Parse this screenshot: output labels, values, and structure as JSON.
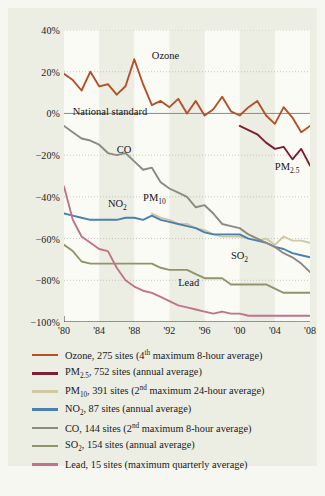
{
  "chart_data": {
    "type": "line",
    "title": "",
    "xlabel": "",
    "ylabel": "",
    "xlim": [
      1980,
      2008
    ],
    "ylim": [
      -100,
      40
    ],
    "grid": "dotted-horizontal",
    "legend_position": "below",
    "ytick_labels": [
      "40%",
      "20%",
      "0%",
      "-20%",
      "-40%",
      "-60%",
      "-80%",
      "-100%"
    ],
    "ytick_values": [
      40,
      20,
      0,
      -20,
      -40,
      -60,
      -80,
      -100
    ],
    "xtick_labels": [
      "'80",
      "'84",
      "'88",
      "'92",
      "'96",
      "'00",
      "'04",
      "'08"
    ],
    "xtick_values": [
      1980,
      1984,
      1988,
      1992,
      1996,
      2000,
      2004,
      2008
    ],
    "annotations": [
      {
        "text": "Ozone",
        "x": 1990,
        "y": 27
      },
      {
        "text": "National standard",
        "x": 1981,
        "y": 0
      },
      {
        "text": "CO",
        "x": 1986,
        "y": -18
      },
      {
        "text": "NO2",
        "x": 1985,
        "y": -44
      },
      {
        "text": "PM10",
        "x": 1989,
        "y": -41
      },
      {
        "text": "PM2.5",
        "x": 2004,
        "y": -26
      },
      {
        "text": "SO2",
        "x": 1999,
        "y": -69
      },
      {
        "text": "Lead",
        "x": 1993,
        "y": -82
      }
    ],
    "reference_line": {
      "label": "National standard",
      "y": 0,
      "color": "#8c8c84"
    },
    "series": [
      {
        "name": "Ozone",
        "label": "Ozone, 275 sites (4th maximum 8-hour average)",
        "color": "#b4502a",
        "x": [
          1980,
          1981,
          1982,
          1983,
          1984,
          1985,
          1986,
          1987,
          1988,
          1989,
          1990,
          1991,
          1992,
          1993,
          1994,
          1995,
          1996,
          1997,
          1998,
          1999,
          2000,
          2001,
          2002,
          2003,
          2004,
          2005,
          2006,
          2007,
          2008
        ],
        "values": [
          19,
          16,
          11,
          20,
          13,
          14,
          9,
          13,
          26,
          14,
          4,
          6,
          3,
          7,
          0,
          6,
          -1,
          2,
          8,
          1,
          -1,
          3,
          6,
          -1,
          -5,
          3,
          -2,
          -9,
          -6
        ]
      },
      {
        "name": "PM2.5",
        "label": "PM2.5, 752 sites (annual average)",
        "color": "#7d1f31",
        "x": [
          2000,
          2001,
          2002,
          2003,
          2004,
          2005,
          2006,
          2007,
          2008
        ],
        "values": [
          -6,
          -8,
          -10,
          -14,
          -17,
          -16,
          -22,
          -17,
          -25
        ]
      },
      {
        "name": "PM10",
        "label": "PM10, 391 sites (2nd maximum 24-hour average)",
        "color": "#cfc8a0",
        "x": [
          1990,
          1991,
          1992,
          1993,
          1994,
          1995,
          1996,
          1997,
          1998,
          1999,
          2000,
          2001,
          2002,
          2003,
          2004,
          2005,
          2006,
          2007,
          2008
        ],
        "values": [
          -48,
          -50,
          -51,
          -53,
          -53,
          -55,
          -56,
          -58,
          -59,
          -59,
          -59,
          -60,
          -61,
          -60,
          -63,
          -59,
          -61,
          -61,
          -62
        ]
      },
      {
        "name": "NO2",
        "label": "NO2, 87 sites (annual average)",
        "color": "#4a7fb0",
        "x": [
          1980,
          1981,
          1982,
          1983,
          1984,
          1985,
          1986,
          1987,
          1988,
          1989,
          1990,
          1991,
          1992,
          1993,
          1994,
          1995,
          1996,
          1997,
          1998,
          1999,
          2000,
          2001,
          2002,
          2003,
          2004,
          2005,
          2006,
          2007,
          2008
        ],
        "values": [
          -48,
          -49,
          -50,
          -51,
          -51,
          -51,
          -51,
          -50,
          -50,
          -51,
          -49,
          -51,
          -52,
          -53,
          -54,
          -55,
          -57,
          -58,
          -58,
          -58,
          -58,
          -60,
          -61,
          -62,
          -64,
          -65,
          -67,
          -68,
          -69
        ]
      },
      {
        "name": "CO",
        "label": "CO, 144 sites (2nd maximum 8-hour average)",
        "color": "#8a8a82",
        "x": [
          1980,
          1981,
          1982,
          1983,
          1984,
          1985,
          1986,
          1987,
          1988,
          1989,
          1990,
          1991,
          1992,
          1993,
          1994,
          1995,
          1996,
          1997,
          1998,
          1999,
          2000,
          2001,
          2002,
          2003,
          2004,
          2005,
          2006,
          2007,
          2008
        ],
        "values": [
          -6,
          -9,
          -12,
          -13,
          -15,
          -19,
          -20,
          -19,
          -23,
          -27,
          -26,
          -33,
          -36,
          -38,
          -40,
          -45,
          -44,
          -48,
          -53,
          -54,
          -55,
          -58,
          -60,
          -62,
          -64,
          -67,
          -69,
          -72,
          -76
        ]
      },
      {
        "name": "SO2",
        "label": "SO2, 154 sites (annual average)",
        "color": "#93936b",
        "x": [
          1980,
          1981,
          1982,
          1983,
          1984,
          1985,
          1986,
          1987,
          1988,
          1989,
          1990,
          1991,
          1992,
          1993,
          1994,
          1995,
          1996,
          1997,
          1998,
          1999,
          2000,
          2001,
          2002,
          2003,
          2004,
          2005,
          2006,
          2007,
          2008
        ],
        "values": [
          -63,
          -66,
          -71,
          -72,
          -72,
          -72,
          -72,
          -72,
          -72,
          -72,
          -72,
          -74,
          -75,
          -75,
          -75,
          -77,
          -79,
          -79,
          -79,
          -82,
          -82,
          -82,
          -82,
          -82,
          -84,
          -86,
          -86,
          -86,
          -86
        ]
      },
      {
        "name": "Lead",
        "label": "Lead, 15 sites (maximum quarterly average)",
        "color": "#c0738a",
        "x": [
          1980,
          1981,
          1982,
          1983,
          1984,
          1985,
          1986,
          1987,
          1988,
          1989,
          1990,
          1991,
          1992,
          1993,
          1994,
          1995,
          1996,
          1997,
          1998,
          1999,
          2000,
          2001,
          2002,
          2003,
          2004,
          2005,
          2006,
          2007,
          2008
        ],
        "values": [
          -35,
          -51,
          -59,
          -62,
          -65,
          -66,
          -74,
          -80,
          -83,
          -85,
          -86,
          -88,
          -90,
          -92,
          -93,
          -94,
          -95,
          -96,
          -95,
          -96,
          -96,
          -97,
          -97,
          -97,
          -97,
          -97,
          -97,
          -97,
          -97
        ]
      }
    ]
  },
  "legend": {
    "items": [
      {
        "color": "#b4502a",
        "name": "Ozone",
        "sub": "",
        "text": "Ozone, 275 sites (4",
        "sup": "th",
        "tail": " maximum 8-hour average)"
      },
      {
        "color": "#7d1f31",
        "name": "PM",
        "sub": "2.5",
        "text": "",
        "sup": "",
        "tail": ", 752 sites (annual average)"
      },
      {
        "color": "#cfc8a0",
        "name": "PM",
        "sub": "10",
        "text": "",
        "sup": "",
        "tail": ", 391 sites (2"
      },
      {
        "color": "#4a7fb0",
        "name": "NO",
        "sub": "2",
        "text": "",
        "sup": "",
        "tail": ", 87 sites (annual average)"
      },
      {
        "color": "#8a8a82",
        "name": "CO",
        "sub": "",
        "text": "",
        "sup": "",
        "tail": ", 144 sites (2"
      },
      {
        "color": "#93936b",
        "name": "SO",
        "sub": "2",
        "text": "",
        "sup": "",
        "tail": ", 154 sites (annual average)"
      },
      {
        "color": "#c0738a",
        "name": "Lead",
        "sub": "",
        "text": "",
        "sup": "",
        "tail": ", 15 sites (maximum quarterly average)"
      }
    ],
    "rows": [
      "Ozone, 275 sites (4th maximum 8-hour average)",
      "PM2.5, 752 sites (annual average)",
      "PM10, 391 sites (2nd maximum 24-hour average)",
      "NO2, 87 sites (annual average)",
      "CO, 144 sites (2nd maximum 8-hour average)",
      "SO2, 154 sites (annual average)",
      "Lead, 15 sites (maximum quarterly average)"
    ]
  },
  "colors": {
    "page_background": "#f7f7f1",
    "card_background": "#eceee4",
    "band_light": "#fbfbf6",
    "grid": "#b9bcae",
    "axis": "#3a3a36",
    "text": "#18181a"
  }
}
